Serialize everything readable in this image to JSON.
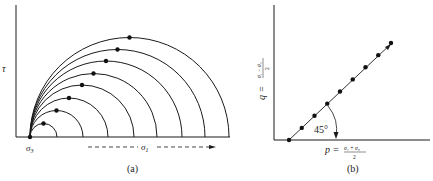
{
  "panel_a": {
    "caption": "(a)",
    "y_axis_label": "τ",
    "sigma3_label": "σ",
    "sigma3_sub": "3",
    "sigma1_label": "σ",
    "sigma1_sub": "1",
    "circles": [
      {
        "right_x": 57
      },
      {
        "right_x": 83
      },
      {
        "right_x": 108
      },
      {
        "right_x": 134
      },
      {
        "right_x": 157
      },
      {
        "right_x": 182
      },
      {
        "right_x": 205
      },
      {
        "right_x": 229
      }
    ]
  },
  "panel_b": {
    "caption": "(b)",
    "y_axis_label": "q =",
    "y_axis_numerator": "σ₁ − σ₃",
    "y_axis_denominator": "2",
    "x_axis_label": "p =",
    "x_axis_numerator": "σ₁ + σ₃",
    "x_axis_denominator": "2",
    "angle_label": "45°",
    "point_count": 9
  },
  "colors": {
    "ink": "#1a1a1a",
    "background": "#ffffff"
  }
}
